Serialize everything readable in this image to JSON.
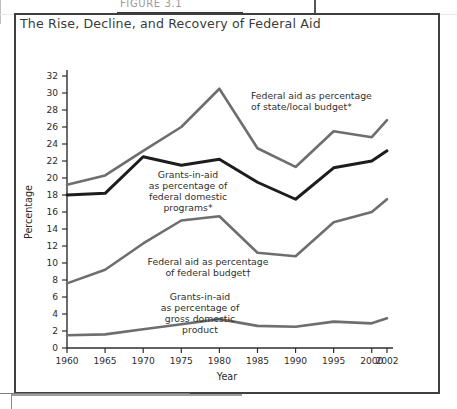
{
  "page": {
    "figure_caption_partial": "FIGURE 3.1",
    "title": "The Rise, Decline, and Recovery of Federal Aid"
  },
  "chart_data": {
    "type": "line",
    "title": "The Rise, Decline, and Recovery of Federal Aid",
    "xlabel": "Year",
    "ylabel": "Percentage",
    "x": [
      1960,
      1965,
      1970,
      1975,
      1980,
      1985,
      1990,
      1995,
      2000,
      2002
    ],
    "xtick_labels": [
      "1960",
      "1965",
      "1970",
      "1975",
      "1980",
      "1985",
      "1990",
      "1995",
      "2000",
      "2002"
    ],
    "xlim": [
      1960,
      2002
    ],
    "ylim": [
      0,
      32
    ],
    "ytick_labels": [
      "0",
      "2",
      "4",
      "6",
      "8",
      "10",
      "12",
      "14",
      "16",
      "18",
      "20",
      "22",
      "24",
      "26",
      "28",
      "30",
      "32"
    ],
    "yticks": [
      0,
      2,
      4,
      6,
      8,
      10,
      12,
      14,
      16,
      18,
      20,
      22,
      24,
      26,
      28,
      30,
      32
    ],
    "grid": false,
    "legend": "annotations-inline",
    "series": [
      {
        "name": "Federal aid as percentage of state/local budget*",
        "color": "#6e6e6e",
        "width": 2.6,
        "values": [
          19.2,
          20.3,
          23.2,
          26.0,
          30.5,
          23.5,
          21.3,
          25.5,
          24.8,
          26.8
        ]
      },
      {
        "name": "Grants-in-aid as percentage of federal domestic programs*",
        "color": "#1d1d1d",
        "width": 3.0,
        "values": [
          18.0,
          18.2,
          22.5,
          21.5,
          22.2,
          19.5,
          17.5,
          21.2,
          22.0,
          23.2
        ]
      },
      {
        "name": "Federal aid as percentage of federal budget†",
        "color": "#6e6e6e",
        "width": 2.6,
        "values": [
          7.6,
          9.2,
          12.3,
          15.0,
          15.5,
          11.2,
          10.8,
          14.8,
          16.0,
          17.5
        ]
      },
      {
        "name": "Grants-in-aid as percentage of gross domestic product",
        "color": "#6e6e6e",
        "width": 2.6,
        "values": [
          1.5,
          1.6,
          2.2,
          2.8,
          3.4,
          2.6,
          2.5,
          3.1,
          2.9,
          3.5
        ]
      }
    ],
    "annotations": [
      {
        "id": "annot-state-local",
        "lines": [
          "Federal aid as percentage",
          "of state/local budget*"
        ],
        "x": 237,
        "y": 86,
        "anchor": "start"
      },
      {
        "id": "annot-federal-domestic",
        "lines": [
          "Grants-in-aid",
          "as percentage of",
          "federal domestic",
          "programs*"
        ],
        "x": 174,
        "y": 165,
        "anchor": "middle"
      },
      {
        "id": "annot-federal-budget",
        "lines": [
          "Federal aid as percentage",
          "of federal budget†"
        ],
        "x": 194,
        "y": 252,
        "anchor": "middle"
      },
      {
        "id": "annot-gdp",
        "lines": [
          "Grants-in-aid",
          "as percentage of",
          "gross domestic",
          "product"
        ],
        "x": 186,
        "y": 287,
        "anchor": "middle"
      }
    ]
  }
}
